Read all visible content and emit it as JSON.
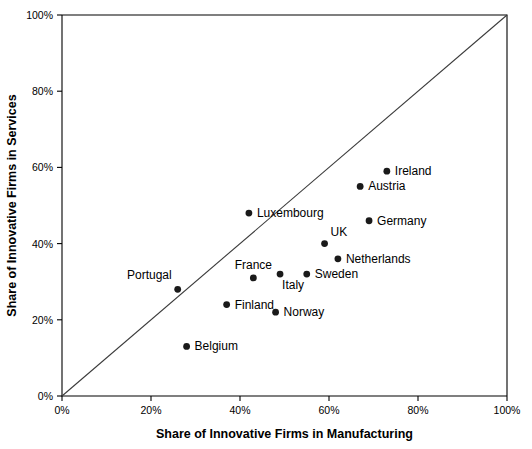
{
  "chart_data": {
    "type": "scatter",
    "title": "",
    "xlabel": "Share of Innovative Firms in Manufacturing",
    "ylabel": "Share of Innovative Firms in Services",
    "xlim": [
      0,
      100
    ],
    "ylim": [
      0,
      100
    ],
    "xticks": [
      "0%",
      "20%",
      "40%",
      "60%",
      "80%",
      "100%"
    ],
    "xtick_values": [
      0,
      20,
      40,
      60,
      80,
      100
    ],
    "yticks": [
      "0%",
      "20%",
      "40%",
      "60%",
      "80%",
      "100%"
    ],
    "ytick_values": [
      0,
      20,
      40,
      60,
      80,
      100
    ],
    "grid": false,
    "legend": "none",
    "annotations": [
      {
        "name": "diagonal-45-degree-reference-line",
        "from": [
          0,
          0
        ],
        "to": [
          100,
          100
        ]
      }
    ],
    "points": [
      {
        "label": "Ireland",
        "x": 73,
        "y": 59,
        "label_pos": "right"
      },
      {
        "label": "Austria",
        "x": 67,
        "y": 55,
        "label_pos": "right"
      },
      {
        "label": "Germany",
        "x": 69,
        "y": 46,
        "label_pos": "right"
      },
      {
        "label": "Luxembourg",
        "x": 42,
        "y": 48,
        "label_pos": "right"
      },
      {
        "label": "UK",
        "x": 59,
        "y": 40,
        "label_pos": "above-right"
      },
      {
        "label": "Netherlands",
        "x": 62,
        "y": 36,
        "label_pos": "right"
      },
      {
        "label": "Sweden",
        "x": 55,
        "y": 32,
        "label_pos": "right"
      },
      {
        "label": "Italy",
        "x": 49,
        "y": 32,
        "label_pos": "below-right"
      },
      {
        "label": "France",
        "x": 43,
        "y": 31,
        "label_pos": "above"
      },
      {
        "label": "Portugal",
        "x": 26,
        "y": 28,
        "label_pos": "above-left"
      },
      {
        "label": "Finland",
        "x": 37,
        "y": 24,
        "label_pos": "right"
      },
      {
        "label": "Norway",
        "x": 48,
        "y": 22,
        "label_pos": "right"
      },
      {
        "label": "Belgium",
        "x": 28,
        "y": 13,
        "label_pos": "right"
      }
    ],
    "colors": {
      "marker": "#1a1a1a",
      "axis": "#000000",
      "reference_line": "#3a3a3a",
      "background": "#ffffff"
    }
  }
}
